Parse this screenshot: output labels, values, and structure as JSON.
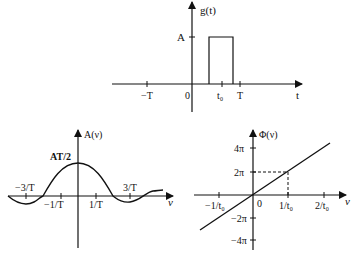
{
  "top": {
    "y_label": "g(t)",
    "x_label": "t",
    "amp_label": "A",
    "ticks": [
      "−T",
      "0",
      "t₀",
      "T"
    ]
  },
  "bottom_left": {
    "y_label": "A(ν)",
    "x_label": "ν",
    "peak_label": "AT/2",
    "ticks": [
      "−3/T",
      "−1/T",
      "1/T",
      "3/T"
    ]
  },
  "bottom_right": {
    "y_label": "Φ(ν)",
    "x_label": "ν",
    "origin": "0",
    "x_ticks": [
      "−1/t₀",
      "1/t₀",
      "2/t₀"
    ],
    "y_ticks": [
      "4π",
      "2π",
      "−2π",
      "−4π"
    ]
  }
}
